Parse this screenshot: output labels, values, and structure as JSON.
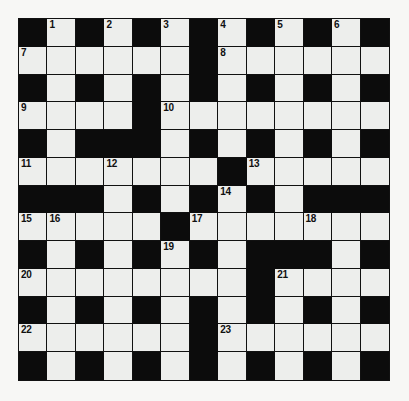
{
  "puzzle": {
    "title": "Crossword Grid",
    "type": "crossword",
    "rows": 13,
    "cols": 13,
    "colors": {
      "page_background": "#f7f7f5",
      "block_cell": "#0c0c0c",
      "open_cell": "#edeeec",
      "grid_line": "#111111",
      "number_text": "#101010"
    },
    "grid": [
      [
        "block",
        "open",
        "block",
        "open",
        "block",
        "open",
        "block",
        "open",
        "block",
        "open",
        "block",
        "open",
        "block"
      ],
      [
        "open",
        "open",
        "open",
        "open",
        "open",
        "open",
        "block",
        "open",
        "open",
        "open",
        "open",
        "open",
        "open"
      ],
      [
        "block",
        "open",
        "block",
        "open",
        "block",
        "open",
        "block",
        "open",
        "block",
        "open",
        "block",
        "open",
        "block"
      ],
      [
        "open",
        "open",
        "open",
        "open",
        "block",
        "open",
        "open",
        "open",
        "open",
        "open",
        "open",
        "open",
        "open"
      ],
      [
        "block",
        "open",
        "block",
        "block",
        "block",
        "open",
        "block",
        "open",
        "block",
        "open",
        "block",
        "open",
        "block"
      ],
      [
        "open",
        "open",
        "open",
        "open",
        "open",
        "open",
        "open",
        "block",
        "open",
        "open",
        "open",
        "open",
        "open"
      ],
      [
        "block",
        "block",
        "block",
        "open",
        "block",
        "open",
        "block",
        "open",
        "block",
        "open",
        "block",
        "block",
        "block"
      ],
      [
        "open",
        "open",
        "open",
        "open",
        "open",
        "block",
        "open",
        "open",
        "open",
        "open",
        "open",
        "open",
        "open"
      ],
      [
        "block",
        "open",
        "block",
        "open",
        "block",
        "open",
        "block",
        "open",
        "block",
        "block",
        "block",
        "open",
        "block"
      ],
      [
        "open",
        "open",
        "open",
        "open",
        "open",
        "open",
        "open",
        "open",
        "block",
        "open",
        "open",
        "open",
        "open"
      ],
      [
        "block",
        "open",
        "block",
        "open",
        "block",
        "open",
        "block",
        "open",
        "block",
        "open",
        "block",
        "open",
        "block"
      ],
      [
        "open",
        "open",
        "open",
        "open",
        "open",
        "open",
        "block",
        "open",
        "open",
        "open",
        "open",
        "open",
        "open"
      ],
      [
        "block",
        "open",
        "block",
        "open",
        "block",
        "open",
        "block",
        "open",
        "block",
        "open",
        "block",
        "open",
        "block"
      ]
    ],
    "numbers": [
      {
        "row": 0,
        "col": 1,
        "label": "1"
      },
      {
        "row": 0,
        "col": 3,
        "label": "2"
      },
      {
        "row": 0,
        "col": 5,
        "label": "3"
      },
      {
        "row": 0,
        "col": 7,
        "label": "4"
      },
      {
        "row": 0,
        "col": 9,
        "label": "5"
      },
      {
        "row": 0,
        "col": 11,
        "label": "6"
      },
      {
        "row": 1,
        "col": 0,
        "label": "7"
      },
      {
        "row": 1,
        "col": 7,
        "label": "8"
      },
      {
        "row": 3,
        "col": 0,
        "label": "9"
      },
      {
        "row": 3,
        "col": 5,
        "label": "10"
      },
      {
        "row": 5,
        "col": 0,
        "label": "11"
      },
      {
        "row": 5,
        "col": 3,
        "label": "12"
      },
      {
        "row": 5,
        "col": 8,
        "label": "13"
      },
      {
        "row": 6,
        "col": 7,
        "label": "14"
      },
      {
        "row": 7,
        "col": 0,
        "label": "15"
      },
      {
        "row": 7,
        "col": 1,
        "label": "16"
      },
      {
        "row": 7,
        "col": 6,
        "label": "17"
      },
      {
        "row": 7,
        "col": 10,
        "label": "18"
      },
      {
        "row": 8,
        "col": 5,
        "label": "19"
      },
      {
        "row": 9,
        "col": 0,
        "label": "20"
      },
      {
        "row": 9,
        "col": 9,
        "label": "21"
      },
      {
        "row": 11,
        "col": 0,
        "label": "22"
      },
      {
        "row": 11,
        "col": 7,
        "label": "23"
      }
    ],
    "entries": []
  }
}
